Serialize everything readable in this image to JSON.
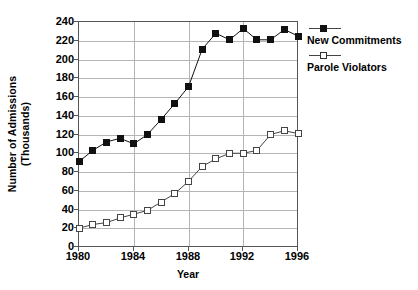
{
  "chart_data": {
    "type": "line",
    "title": "",
    "xlabel": "Year",
    "ylabel": "Number of Admissions (Thousands)",
    "ylabel_line1": "Number of Admissions",
    "ylabel_line2": "(Thousands)",
    "grid": true,
    "legend_position": "right",
    "xlim": [
      1980,
      1996
    ],
    "ylim": [
      0,
      240
    ],
    "xticks": [
      1980,
      1984,
      1988,
      1992,
      1996
    ],
    "xtick_labels": [
      "1980",
      "1984",
      "1988",
      "1992",
      "1996"
    ],
    "yticks": [
      0,
      20,
      40,
      60,
      80,
      100,
      120,
      140,
      160,
      180,
      200,
      220,
      240
    ],
    "ytick_labels": [
      "0",
      "20",
      "40",
      "60",
      "80",
      "100",
      "120",
      "140",
      "160",
      "180",
      "200",
      "220",
      "240"
    ],
    "x": [
      1980,
      1981,
      1982,
      1983,
      1984,
      1985,
      1986,
      1987,
      1988,
      1989,
      1990,
      1991,
      1992,
      1993,
      1994,
      1995,
      1996
    ],
    "series": [
      {
        "name": "New Commitments",
        "marker": "filled-square",
        "color": "#111111",
        "values": [
          91,
          103,
          112,
          116,
          110,
          120,
          136,
          153,
          171,
          211,
          228,
          221,
          233,
          221,
          221,
          232,
          225
        ]
      },
      {
        "name": "Parole Violators",
        "marker": "open-square",
        "color": "#444444",
        "values": [
          20,
          24,
          26,
          31,
          35,
          39,
          48,
          57,
          70,
          86,
          94,
          100,
          100,
          103,
          120,
          124,
          121
        ]
      }
    ]
  },
  "legend": {
    "entries": [
      {
        "label": "New Commitments",
        "marker": "filled-square"
      },
      {
        "label": "Parole Violators",
        "marker": "open-square"
      }
    ]
  },
  "axes": {
    "x_title": "Year",
    "y_title_line1": "Number of Admissions",
    "y_title_line2": "(Thousands)"
  }
}
